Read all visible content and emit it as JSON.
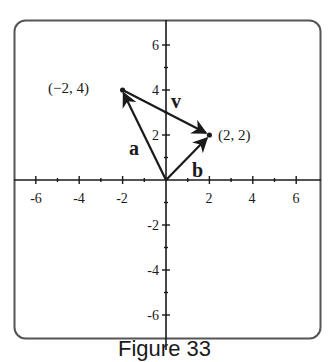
{
  "figure": {
    "caption": "Figure 33",
    "frame_color": "#555555",
    "ink_color": "#1a1a1a"
  },
  "axes": {
    "x_ticks": [
      {
        "value": -6,
        "label": "-6"
      },
      {
        "value": -4,
        "label": "-4"
      },
      {
        "value": -2,
        "label": "-2"
      },
      {
        "value": 2,
        "label": "2"
      },
      {
        "value": 4,
        "label": "4"
      },
      {
        "value": 6,
        "label": "6"
      }
    ],
    "y_ticks": [
      {
        "value": 6,
        "label": "6"
      },
      {
        "value": 4,
        "label": "4"
      },
      {
        "value": 2,
        "label": "2"
      },
      {
        "value": -2,
        "label": "-2"
      },
      {
        "value": -4,
        "label": "-4"
      },
      {
        "value": -6,
        "label": "-6"
      }
    ],
    "xlim": [
      -7,
      7
    ],
    "ylim": [
      -7,
      7
    ]
  },
  "points": [
    {
      "name": "P1",
      "x": -2,
      "y": 4,
      "label": "(−2, 4)"
    },
    {
      "name": "P2",
      "x": 2,
      "y": 2,
      "label": "(2, 2)"
    }
  ],
  "vectors": [
    {
      "name": "a",
      "label": "a",
      "from": [
        0,
        0
      ],
      "to": [
        -2,
        4
      ]
    },
    {
      "name": "b",
      "label": "b",
      "from": [
        0,
        0
      ],
      "to": [
        2,
        2
      ]
    },
    {
      "name": "v",
      "label": "v",
      "from": [
        -2,
        4
      ],
      "to": [
        2,
        2
      ]
    }
  ],
  "labels": {
    "x_tick_neg6": "-6",
    "x_tick_neg4": "-4",
    "x_tick_neg2": "-2",
    "x_tick_2": "2",
    "x_tick_4": "4",
    "x_tick_6": "6",
    "y_tick_6": "6",
    "y_tick_4": "4",
    "y_tick_2": "2",
    "y_tick_neg2": "-2",
    "y_tick_neg4": "-4",
    "y_tick_neg6": "-6",
    "point_p1": "(−2, 4)",
    "point_p2": "(2, 2)",
    "vec_a": "a",
    "vec_b": "b",
    "vec_v": "v"
  }
}
